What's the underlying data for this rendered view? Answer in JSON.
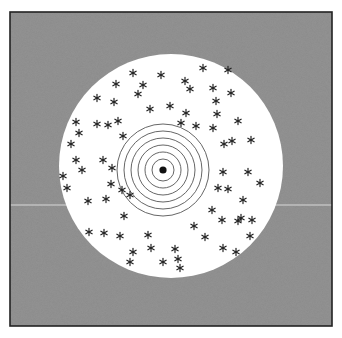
{
  "figure": {
    "background": "#ffffff",
    "frame": {
      "x": 10,
      "y": 12,
      "width": 322,
      "height": 314,
      "stroke": "#222222",
      "fill": "#8c8c8c",
      "noise": true
    },
    "disc": {
      "cx": 171,
      "cy": 166,
      "r": 112,
      "fill": "#ffffff"
    },
    "target": {
      "cx": 163,
      "cy": 170,
      "ring_radii": [
        11,
        18,
        25,
        32,
        39,
        46
      ],
      "ring_stroke": "#555555",
      "center_dot_r": 3.6,
      "center_dot_fill": "#111111"
    },
    "scan_line": {
      "y": 205,
      "color": "#d8d8d8"
    },
    "stars": {
      "glyph": "*",
      "color": "#222222",
      "positions": [
        [
          133,
          73
        ],
        [
          161,
          75
        ],
        [
          116,
          84
        ],
        [
          143,
          85
        ],
        [
          203,
          68
        ],
        [
          228,
          70
        ],
        [
          185,
          81
        ],
        [
          190,
          89
        ],
        [
          138,
          94
        ],
        [
          213,
          88
        ],
        [
          97,
          98
        ],
        [
          114,
          102
        ],
        [
          216,
          101
        ],
        [
          231,
          93
        ],
        [
          170,
          106
        ],
        [
          150,
          109
        ],
        [
          217,
          114
        ],
        [
          186,
          113
        ],
        [
          181,
          123
        ],
        [
          238,
          121
        ],
        [
          196,
          126
        ],
        [
          76,
          122
        ],
        [
          97,
          124
        ],
        [
          108,
          125
        ],
        [
          118,
          121
        ],
        [
          79,
          133
        ],
        [
          123,
          136
        ],
        [
          71,
          144
        ],
        [
          213,
          128
        ],
        [
          232,
          141
        ],
        [
          251,
          140
        ],
        [
          224,
          144
        ],
        [
          76,
          160
        ],
        [
          82,
          170
        ],
        [
          103,
          160
        ],
        [
          111,
          184
        ],
        [
          112,
          168
        ],
        [
          88,
          201
        ],
        [
          106,
          199
        ],
        [
          122,
          190
        ],
        [
          130,
          195
        ],
        [
          63,
          176
        ],
        [
          67,
          188
        ],
        [
          124,
          216
        ],
        [
          223,
          172
        ],
        [
          248,
          172
        ],
        [
          260,
          183
        ],
        [
          218,
          188
        ],
        [
          228,
          189
        ],
        [
          243,
          200
        ],
        [
          212,
          210
        ],
        [
          222,
          220
        ],
        [
          238,
          221
        ],
        [
          241,
          218
        ],
        [
          250,
          236
        ],
        [
          205,
          237
        ],
        [
          194,
          226
        ],
        [
          104,
          233
        ],
        [
          120,
          236
        ],
        [
          148,
          235
        ],
        [
          89,
          232
        ],
        [
          151,
          248
        ],
        [
          175,
          249
        ],
        [
          178,
          259
        ],
        [
          163,
          262
        ],
        [
          223,
          248
        ],
        [
          236,
          252
        ],
        [
          252,
          220
        ],
        [
          180,
          268
        ],
        [
          130,
          262
        ],
        [
          133,
          252
        ]
      ]
    }
  }
}
